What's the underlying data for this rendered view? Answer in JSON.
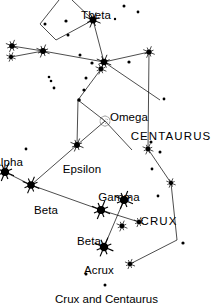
{
  "figure": {
    "caption": "Crux and Centaurus",
    "background_color": "#ffffff",
    "ink_color": "#000000",
    "width": 213,
    "height": 305
  },
  "chart_data": {
    "type": "scatter",
    "title": "Crux and Centaurus",
    "xlabel": "",
    "ylabel": "",
    "xlim": [
      0,
      213
    ],
    "ylim": [
      0,
      305
    ],
    "grid": false,
    "legend": null,
    "labels": [
      {
        "text": "Theta",
        "x": 96,
        "y": 10,
        "kind": "star-name",
        "anchor": "middle"
      },
      {
        "text": "Omega",
        "x": 129,
        "y": 112,
        "kind": "object-name",
        "anchor": "middle"
      },
      {
        "text": "CENTAURUS",
        "x": 171,
        "y": 131,
        "kind": "constellation-name",
        "anchor": "middle"
      },
      {
        "text": "Alpha",
        "x": 8,
        "y": 157,
        "kind": "star-name",
        "anchor": "middle"
      },
      {
        "text": "Epsilon",
        "x": 82,
        "y": 164,
        "kind": "star-name",
        "anchor": "middle"
      },
      {
        "text": "Beta",
        "x": 46,
        "y": 205,
        "kind": "star-name",
        "anchor": "middle"
      },
      {
        "text": "Gamma",
        "x": 119,
        "y": 192,
        "kind": "star-name",
        "anchor": "middle"
      },
      {
        "text": "CRUX",
        "x": 159,
        "y": 216,
        "kind": "constellation-name",
        "anchor": "middle"
      },
      {
        "text": "Beta",
        "x": 89,
        "y": 236,
        "kind": "star-name",
        "anchor": "middle"
      },
      {
        "text": "Acrux",
        "x": 99,
        "y": 265,
        "kind": "star-name",
        "anchor": "middle"
      }
    ],
    "stars": [
      {
        "name": "theta-centauri",
        "x": 93,
        "y": 20,
        "mag_r": 4.2,
        "style": "bright"
      },
      {
        "name": "star-left-outer-a",
        "x": 12,
        "y": 46,
        "mag_r": 3.4,
        "style": "bright"
      },
      {
        "name": "star-left-outer-b",
        "x": 11,
        "y": 57,
        "mag_r": 2.6,
        "style": "bright"
      },
      {
        "name": "star-iota-centauri",
        "x": 43,
        "y": 51,
        "mag_r": 3.6,
        "style": "bright"
      },
      {
        "name": "star-hub-upper",
        "x": 104,
        "y": 62,
        "mag_r": 4.0,
        "style": "bright"
      },
      {
        "name": "star-hub-lower",
        "x": 101,
        "y": 69,
        "mag_r": 3.0,
        "style": "bright"
      },
      {
        "name": "star-right-upper",
        "x": 149,
        "y": 52,
        "mag_r": 3.2,
        "style": "bright"
      },
      {
        "name": "star-below-omega",
        "x": 77,
        "y": 145,
        "mag_r": 3.6,
        "style": "bright"
      },
      {
        "name": "alpha-centauri",
        "x": 5,
        "y": 172,
        "mag_r": 5.0,
        "style": "bright"
      },
      {
        "name": "beta-centauri",
        "x": 31,
        "y": 185,
        "mag_r": 4.6,
        "style": "bright"
      },
      {
        "name": "delta-crucis",
        "x": 101,
        "y": 210,
        "mag_r": 5.0,
        "style": "bright"
      },
      {
        "name": "gamma-crucis",
        "x": 124,
        "y": 200,
        "mag_r": 5.0,
        "style": "bright"
      },
      {
        "name": "beta-crucis",
        "x": 122,
        "y": 226,
        "mag_r": 3.0,
        "style": "bright"
      },
      {
        "name": "epsilon-crucis",
        "x": 139,
        "y": 222,
        "mag_r": 2.8,
        "style": "bright"
      },
      {
        "name": "acrux",
        "x": 104,
        "y": 247,
        "mag_r": 5.2,
        "style": "bright"
      },
      {
        "name": "star-centaurus-right-upper",
        "x": 148,
        "y": 149,
        "mag_r": 3.0,
        "style": "bright"
      },
      {
        "name": "star-centaurus-right-mid",
        "x": 171,
        "y": 183,
        "mag_r": 2.6,
        "style": "bright"
      },
      {
        "name": "star-centaurus-lower",
        "x": 130,
        "y": 264,
        "mag_r": 2.8,
        "style": "bright"
      }
    ],
    "faint_stars": [
      {
        "x": 124,
        "y": 6,
        "r": 1.5
      },
      {
        "x": 138,
        "y": 12,
        "r": 1.4
      },
      {
        "x": 115,
        "y": 19,
        "r": 1.2
      },
      {
        "x": 45,
        "y": 24,
        "r": 1.5
      },
      {
        "x": 66,
        "y": 21,
        "r": 1.6
      },
      {
        "x": 68,
        "y": 35,
        "r": 1.5
      },
      {
        "x": 80,
        "y": 55,
        "r": 1.5
      },
      {
        "x": 92,
        "y": 63,
        "r": 1.6
      },
      {
        "x": 129,
        "y": 62,
        "r": 1.6
      },
      {
        "x": 164,
        "y": 99,
        "r": 1.4
      },
      {
        "x": 49,
        "y": 77,
        "r": 1.3
      },
      {
        "x": 51,
        "y": 81,
        "r": 1.3
      },
      {
        "x": 54,
        "y": 88,
        "r": 1.4
      },
      {
        "x": 86,
        "y": 78,
        "r": 1.5
      },
      {
        "x": 84,
        "y": 90,
        "r": 1.6
      },
      {
        "x": 79,
        "y": 100,
        "r": 1.8
      },
      {
        "x": 160,
        "y": 152,
        "r": 1.5
      },
      {
        "x": 152,
        "y": 169,
        "r": 1.4
      },
      {
        "x": 158,
        "y": 196,
        "r": 1.4
      },
      {
        "x": 151,
        "y": 142,
        "r": 1.5
      },
      {
        "x": 183,
        "y": 243,
        "r": 1.6
      },
      {
        "x": 86,
        "y": 274,
        "r": 1.5
      },
      {
        "x": 105,
        "y": 285,
        "r": 1.5
      },
      {
        "x": 26,
        "y": 149,
        "r": 1.4
      }
    ],
    "cluster": {
      "name": "omega-centauri",
      "x": 105,
      "y": 121,
      "r": 5.0,
      "symbol": "stippled-circle"
    },
    "lines": [
      {
        "from": [
          59,
          0
        ],
        "to": [
          40,
          24
        ]
      },
      {
        "from": [
          40,
          24
        ],
        "to": [
          56,
          40
        ]
      },
      {
        "from": [
          56,
          40
        ],
        "to": [
          93,
          20
        ]
      },
      {
        "from": [
          93,
          20
        ],
        "to": [
          72,
          0
        ]
      },
      {
        "from": [
          93,
          20
        ],
        "to": [
          104,
          62
        ]
      },
      {
        "from": [
          12,
          46
        ],
        "to": [
          43,
          51
        ]
      },
      {
        "from": [
          11,
          57
        ],
        "to": [
          43,
          51
        ]
      },
      {
        "from": [
          43,
          51
        ],
        "to": [
          104,
          62
        ]
      },
      {
        "from": [
          104,
          62
        ],
        "to": [
          149,
          52
        ]
      },
      {
        "from": [
          104,
          62
        ],
        "to": [
          160,
          100
        ]
      },
      {
        "from": [
          101,
          69
        ],
        "to": [
          78,
          100
        ]
      },
      {
        "from": [
          78,
          100
        ],
        "to": [
          77,
          145
        ]
      },
      {
        "from": [
          77,
          145
        ],
        "to": [
          105,
          121
        ]
      },
      {
        "from": [
          105,
          121
        ],
        "to": [
          132,
          150
        ]
      },
      {
        "from": [
          105,
          121
        ],
        "to": [
          78,
          100
        ]
      },
      {
        "from": [
          5,
          172
        ],
        "to": [
          31,
          185
        ]
      },
      {
        "from": [
          31,
          185
        ],
        "to": [
          77,
          145
        ]
      },
      {
        "from": [
          31,
          185
        ],
        "to": [
          101,
          210
        ]
      },
      {
        "from": [
          101,
          210
        ],
        "to": [
          139,
          222
        ]
      },
      {
        "from": [
          124,
          200
        ],
        "to": [
          104,
          247
        ]
      },
      {
        "from": [
          149,
          52
        ],
        "to": [
          148,
          149
        ]
      },
      {
        "from": [
          148,
          149
        ],
        "to": [
          171,
          183
        ]
      },
      {
        "from": [
          171,
          183
        ],
        "to": [
          177,
          240
        ]
      },
      {
        "from": [
          177,
          240
        ],
        "to": [
          130,
          264
        ]
      }
    ]
  }
}
